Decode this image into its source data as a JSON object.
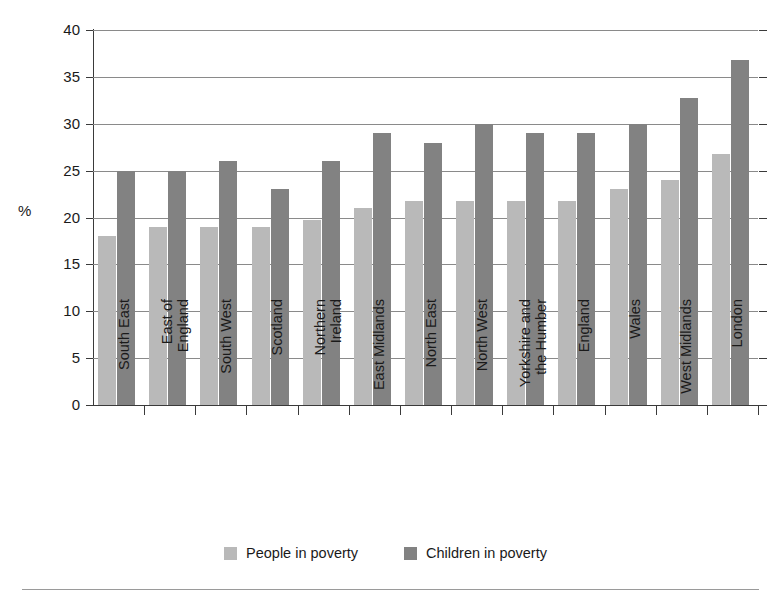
{
  "chart_data": {
    "type": "bar",
    "title": "",
    "subtitle": "",
    "xlabel": "",
    "ylabel": "%",
    "ylim": [
      0,
      40
    ],
    "yticks": [
      0,
      5,
      10,
      15,
      20,
      25,
      30,
      35,
      40
    ],
    "ytick_labels": [
      "0",
      "5",
      "10",
      "15",
      "20",
      "25",
      "30",
      "35",
      "40"
    ],
    "grid": true,
    "legend_position": "bottom-center",
    "categories": [
      "South East",
      "East of\nEngland",
      "South West",
      "Scotland",
      "Northern\nIreland",
      "East Midlands",
      "North East",
      "North West",
      "Yorkshire and\nthe Humber",
      "England",
      "Wales",
      "West Midlands",
      "London"
    ],
    "series": [
      {
        "name": "People in poverty",
        "color": "#b9b9b9",
        "values": [
          18.0,
          19.0,
          19.0,
          19.0,
          19.7,
          21.0,
          21.8,
          21.8,
          21.8,
          21.8,
          23.0,
          24.0,
          26.8
        ]
      },
      {
        "name": "Children in poverty",
        "color": "#828282",
        "values": [
          25.0,
          25.0,
          26.0,
          23.0,
          26.0,
          29.0,
          28.0,
          30.0,
          29.0,
          29.0,
          30.0,
          32.7,
          36.8
        ]
      }
    ]
  },
  "legend": {
    "entries": [
      {
        "label": "People in poverty",
        "swatch": "people"
      },
      {
        "label": "Children in poverty",
        "swatch": "children"
      }
    ]
  },
  "axis": {
    "y_title": "%"
  }
}
